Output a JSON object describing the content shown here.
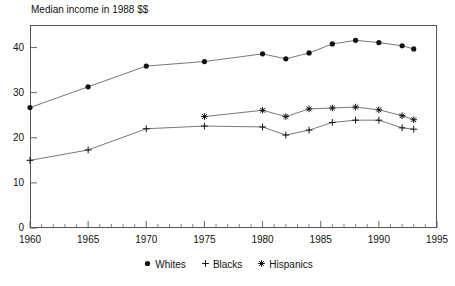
{
  "chart_data": {
    "type": "line",
    "title": "Median income in 1988 $$",
    "xlabel": "",
    "ylabel": "",
    "xlim": [
      1960,
      1995
    ],
    "ylim": [
      0,
      45
    ],
    "grid": false,
    "legend_position": "bottom-center",
    "x_ticks_major": [
      1960,
      1965,
      1970,
      1975,
      1980,
      1985,
      1990,
      1995
    ],
    "x_ticks_minor_step": 1,
    "y_ticks": [
      0,
      10,
      20,
      30,
      40
    ],
    "series": [
      {
        "name": "Whites",
        "marker": "filled-circle",
        "x": [
          1960,
          1965,
          1970,
          1975,
          1980,
          1982,
          1984,
          1986,
          1988,
          1990,
          1992,
          1993
        ],
        "values": [
          26.7,
          31.3,
          35.9,
          36.9,
          38.6,
          37.5,
          38.8,
          40.8,
          41.6,
          41.1,
          40.4,
          39.7
        ]
      },
      {
        "name": "Blacks",
        "marker": "plus",
        "x": [
          1960,
          1965,
          1970,
          1975,
          1980,
          1982,
          1984,
          1986,
          1988,
          1990,
          1992,
          1993
        ],
        "values": [
          15.0,
          17.3,
          22.0,
          22.6,
          22.4,
          20.6,
          21.7,
          23.4,
          23.9,
          23.9,
          22.2,
          21.9
        ]
      },
      {
        "name": "Hispanics",
        "marker": "star",
        "x": [
          1975,
          1980,
          1982,
          1984,
          1986,
          1988,
          1990,
          1992,
          1993
        ],
        "values": [
          24.7,
          26.1,
          24.7,
          26.4,
          26.6,
          26.8,
          26.2,
          24.9,
          24.0
        ]
      }
    ]
  },
  "legend": {
    "entries": [
      {
        "label": "Whites",
        "marker": "filled-circle"
      },
      {
        "label": "Blacks",
        "marker": "plus"
      },
      {
        "label": "Hispanics",
        "marker": "star"
      }
    ]
  },
  "axis": {
    "y_labels": [
      "40",
      "30",
      "20",
      "10",
      "0"
    ],
    "x_labels": [
      "1960",
      "1965",
      "1970",
      "1975",
      "1980",
      "1985",
      "1990",
      "1995"
    ]
  },
  "colors": {
    "line": "#555555",
    "marker": "#111111",
    "frame": "#555555",
    "text": "#111111",
    "background": "#ffffff"
  }
}
